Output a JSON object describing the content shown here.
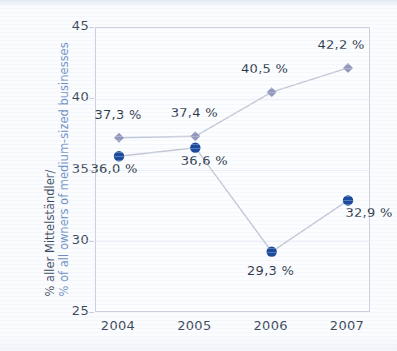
{
  "chart_data": {
    "type": "line",
    "title": "",
    "xlabel": "",
    "ylabel_line1": "% aller Mittelständler/",
    "ylabel_line2": "% of all owners of medium-sized businesses",
    "categories": [
      "2004",
      "2005",
      "2006",
      "2007"
    ],
    "ylim": [
      25,
      45
    ],
    "yticks": [
      25,
      30,
      35,
      40,
      45
    ],
    "ytick_labels": [
      "25",
      "30",
      "35",
      "40",
      "45"
    ],
    "grid": true,
    "legend": "none",
    "series": [
      {
        "name": "light-series",
        "marker": "diamond",
        "color": "#8f93b9",
        "line_color": "#c2c7d6",
        "values": [
          37.3,
          37.4,
          40.5,
          42.2
        ],
        "labels": [
          "37,3 %",
          "37,4 %",
          "40,5 %",
          "42,2 %"
        ]
      },
      {
        "name": "dark-series",
        "marker": "circle",
        "color": "#1c4a9c",
        "line_color": "#c2c7d6",
        "values": [
          36.0,
          36.6,
          29.3,
          32.9
        ],
        "labels": [
          "36,0 %",
          "36,6 %",
          "29,3 %",
          "32,9 %"
        ]
      }
    ],
    "annotations": [
      {
        "text": "37,3 %",
        "series": "light-series",
        "x": "2004",
        "value": 37.3
      },
      {
        "text": "37,4 %",
        "series": "light-series",
        "x": "2005",
        "value": 37.4
      },
      {
        "text": "40,5 %",
        "series": "light-series",
        "x": "2006",
        "value": 40.5
      },
      {
        "text": "42,2 %",
        "series": "light-series",
        "x": "2007",
        "value": 42.2
      },
      {
        "text": "36,0 %",
        "series": "dark-series",
        "x": "2004",
        "value": 36.0
      },
      {
        "text": "36,6 %",
        "series": "dark-series",
        "x": "2005",
        "value": 36.6
      },
      {
        "text": "29,3 %",
        "series": "dark-series",
        "x": "2006",
        "value": 29.3
      },
      {
        "text": "32,9 %",
        "series": "dark-series",
        "x": "2007",
        "value": 32.9
      }
    ],
    "colors": {
      "accent_dark": "#1c4a9c",
      "accent_light": "#8f93b9",
      "line": "#c2c7d6",
      "axis": "#c9cfdc",
      "tick_text": "#3c4757",
      "label_text": "#2f3a49",
      "ylabel_secondary": "#6d8fc4",
      "background": "#fbfcfe"
    }
  }
}
